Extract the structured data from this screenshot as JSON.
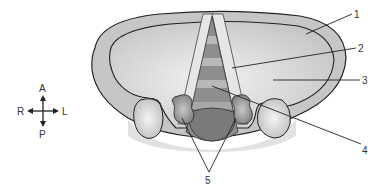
{
  "diagram": {
    "type": "anatomical-diagram",
    "labels": [
      {
        "id": "1",
        "text": "1"
      },
      {
        "id": "2",
        "text": "2"
      },
      {
        "id": "3",
        "text": "3"
      },
      {
        "id": "4",
        "text": "4"
      },
      {
        "id": "5",
        "text": "5"
      }
    ],
    "compass": {
      "anterior": "A",
      "posterior": "P",
      "right": "R",
      "left": "L"
    },
    "colors": {
      "outer_rim": "#c9c9c9",
      "inner_fill": "#d8d8d8",
      "stripe_light": "#b5b5b5",
      "stripe_dark": "#8a8a8a",
      "band": "#e4e4e4",
      "bulb": "#7d7d7d",
      "outline": "#222222",
      "lobe": "#a8a8a8"
    }
  }
}
